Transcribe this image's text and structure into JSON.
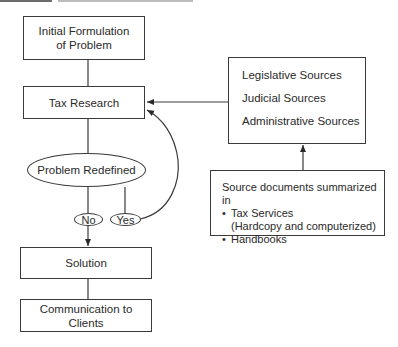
{
  "diagram": {
    "type": "flowchart",
    "nodes": {
      "initial_formulation": "Initial Formulation of Problem",
      "tax_research": "Tax Research",
      "problem_redefined": "Problem Redefined",
      "no_label": "No",
      "yes_label": "Yes",
      "solution": "Solution",
      "communication": "Communication to Clients",
      "sources": [
        "Legislative Sources",
        "Judicial Sources",
        "Administrative Sources"
      ],
      "source_documents": {
        "heading": "Source documents summarized in",
        "bullets": [
          {
            "bullet": "•",
            "text": "Tax Services",
            "continuation": "(Hardcopy and computerized)"
          },
          {
            "bullet": "•",
            "text": "Handbooks"
          }
        ]
      }
    },
    "edges": [
      {
        "from": "Initial Formulation of Problem",
        "to": "Tax Research",
        "arrow": false
      },
      {
        "from": "Tax Research",
        "to": "Problem Redefined",
        "arrow": false
      },
      {
        "from": "Problem Redefined",
        "to": "No",
        "arrow": false
      },
      {
        "from": "Problem Redefined",
        "to": "Yes",
        "arrow": false
      },
      {
        "from": "No",
        "to": "Solution",
        "arrow": true
      },
      {
        "from": "Yes",
        "to": "Tax Research",
        "arrow": true,
        "style": "curved"
      },
      {
        "from": "Legislative/Judicial/Administrative Sources",
        "to": "Tax Research",
        "arrow": true
      },
      {
        "from": "Source documents summarized in",
        "to": "Legislative/Judicial/Administrative Sources",
        "arrow": true
      },
      {
        "from": "Solution",
        "to": "Communication to Clients",
        "arrow": false
      }
    ],
    "colors": {
      "line": "#3a3a3a",
      "text": "#2a2a2a",
      "background": "#ffffff"
    }
  }
}
